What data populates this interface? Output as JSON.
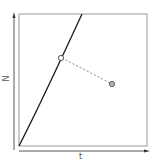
{
  "diagram": {
    "x_axis_label": "t",
    "y_axis_label": "N",
    "colors": {
      "frame": "#9a9a9a",
      "curve": "#1a1a1a",
      "dashed_link": "#8a8a8a",
      "open_marker_fill": "#ffffff",
      "filled_marker_fill": "#b5b5b5",
      "axis_arrow": "#555555"
    },
    "elements": [
      {
        "type": "curve",
        "description": "slightly concave line from origin to top edge"
      },
      {
        "type": "open-circle-marker",
        "on": "curve"
      },
      {
        "type": "dashed-line",
        "from": "open-circle-marker",
        "to": "filled-circle-marker"
      },
      {
        "type": "filled-circle-marker"
      }
    ]
  }
}
